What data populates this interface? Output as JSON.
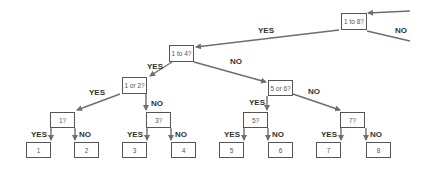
{
  "diagram": {
    "type": "binary decision tree",
    "colors": {
      "edge": "#6e6e6e",
      "box_border": "#555555",
      "text": "#333333"
    },
    "nodes": {
      "root": "1 to 8?",
      "q1to4": "1 to 4?",
      "q1or2": "1 or 2?",
      "q5or6": "5 or 6?",
      "q1": "1?",
      "q3": "3?",
      "q5": "5?",
      "q7": "7?",
      "leaf1": "1",
      "leaf2": "2",
      "leaf3": "3",
      "leaf4": "4",
      "leaf5": "5",
      "leaf6": "6",
      "leaf7": "7",
      "leaf8": "8"
    },
    "labels": {
      "root_yes": "YES",
      "root_no": "NO",
      "q1to4_yes": "YES",
      "q1to4_no": "NO",
      "q1or2_yes": "YES",
      "q1or2_no": "NO",
      "q5or6_yes": "YES",
      "q5or6_no": "NO",
      "q1_yes": "YES",
      "q1_no": "NO",
      "q3_yes": "YES",
      "q3_no": "NO",
      "q5_yes": "YES",
      "q5_no": "NO",
      "q7_yes": "YES",
      "q7_no": "NO"
    }
  }
}
